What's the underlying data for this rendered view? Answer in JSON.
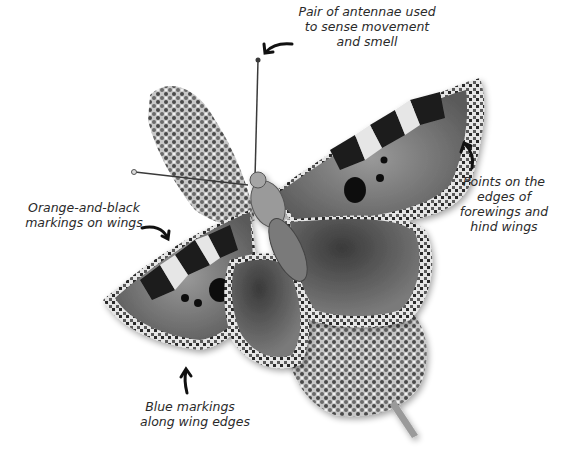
{
  "diagram": {
    "labels": [
      {
        "id": "antennae",
        "lines": [
          "Pair of antennae used",
          "to sense movement",
          "and smell"
        ]
      },
      {
        "id": "points",
        "lines": [
          "Points on the",
          "edges of",
          "forewings and",
          "hind wings"
        ]
      },
      {
        "id": "markings",
        "lines": [
          "Orange-and-black",
          "markings on wings"
        ]
      },
      {
        "id": "blue",
        "lines": [
          "Blue markings",
          "along wing edges"
        ]
      }
    ],
    "colors": {
      "background": "#ffffff",
      "text": "#2a2a2a",
      "arrow": "#111111",
      "wing_dark": "#1a1a1a",
      "wing_mid": "#6e6e6e",
      "wing_light": "#b5b5b5",
      "flower": "#8a8a8a"
    }
  }
}
